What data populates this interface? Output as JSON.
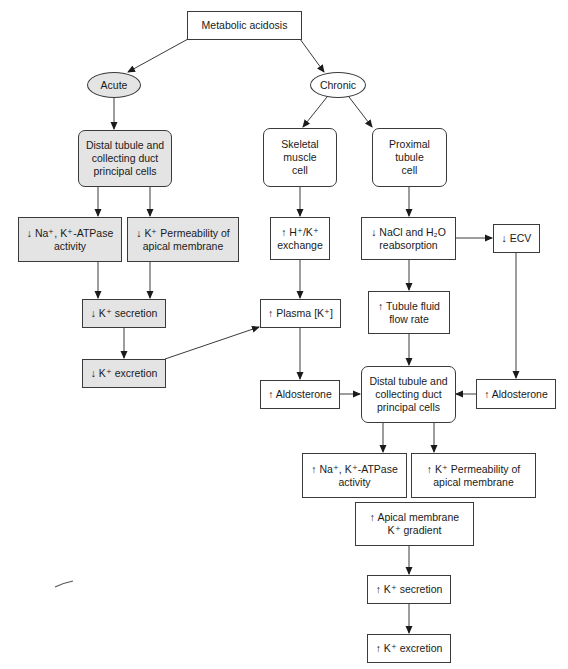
{
  "title": "Metabolic acidosis",
  "branches": {
    "acute": "Acute",
    "chronic": "Chronic"
  },
  "acute": {
    "distal_cells": "Distal tubule and\ncollecting duct\nprincipal cells",
    "na_k_atpase": "↓ Na⁺, K⁺-ATPase\nactivity",
    "k_permeability": "↓ K⁺ Permeability of\napical membrane",
    "k_secretion": "↓ K⁺ secretion",
    "k_excretion": "↓ K⁺ excretion"
  },
  "chronic": {
    "skeletal_muscle": "Skeletal\nmuscle\ncell",
    "proximal_tubule": "Proximal\ntubule\ncell",
    "h_k_exchange": "↑ H⁺/K⁺\nexchange",
    "nacl_reabsorption": "↓ NaCl and H₂O\nreabsorption",
    "ecv": "↓ ECV",
    "plasma_k": "↑ Plasma [K⁺]",
    "tubule_flow": "↑ Tubule fluid\nflow rate",
    "aldosterone_left": "↑ Aldosterone",
    "aldosterone_right": "↑ Aldosterone",
    "distal_cells": "Distal tubule and\ncollecting duct\nprincipal cells",
    "na_k_atpase": "↑ Na⁺, K⁺-ATPase\nactivity",
    "k_permeability": "↑ K⁺ Permeability of\napical membrane",
    "apical_gradient": "↑ Apical membrane\nK⁺ gradient",
    "k_secretion": "↑ K⁺ secretion",
    "k_excretion": "↑ K⁺ excretion"
  },
  "colors": {
    "acute_fill": "#e4e4e4",
    "chronic_fill": "#ffffff",
    "line": "#3a3a3a"
  }
}
